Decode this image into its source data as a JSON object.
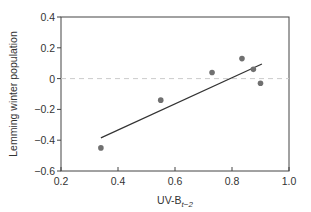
{
  "chart_data": {
    "type": "scatter",
    "title": "",
    "xlabel": "UV-B",
    "xlabel_subscript": "t−2",
    "ylabel": "Lemming winter population",
    "xlim": [
      0.2,
      1.0
    ],
    "ylim": [
      -0.6,
      0.4
    ],
    "xticks": [
      "0.2",
      "0.4",
      "0.6",
      "0.8",
      "1.0"
    ],
    "yticks": [
      "0.4",
      "0.2",
      "0",
      "−0.2",
      "−0.4",
      "−0.6"
    ],
    "grid": false,
    "reference_line": {
      "y": 0,
      "style": "dashed",
      "color": "#cccccc"
    },
    "series": [
      {
        "name": "observations",
        "points": [
          {
            "x": 0.34,
            "y": -0.45
          },
          {
            "x": 0.55,
            "y": -0.14
          },
          {
            "x": 0.73,
            "y": 0.04
          },
          {
            "x": 0.835,
            "y": 0.13
          },
          {
            "x": 0.875,
            "y": 0.06
          },
          {
            "x": 0.9,
            "y": -0.03
          }
        ],
        "color": "#707070"
      }
    ],
    "regression_line": {
      "x": [
        0.34,
        0.905
      ],
      "y": [
        -0.385,
        0.095
      ],
      "color": "#333333"
    }
  }
}
